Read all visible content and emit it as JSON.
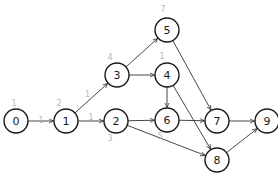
{
  "diagram": {
    "type": "directed-graph",
    "node_color": "#1a1a1a",
    "annotation_color": "#b8b8b8",
    "nodes": [
      {
        "id": "0",
        "label": "0",
        "annotation": "1"
      },
      {
        "id": "1",
        "label": "1",
        "annotation": "2"
      },
      {
        "id": "2",
        "label": "2",
        "annotation": "3"
      },
      {
        "id": "3",
        "label": "3",
        "annotation": "4"
      },
      {
        "id": "4",
        "label": "4",
        "annotation": "1"
      },
      {
        "id": "5",
        "label": "5",
        "annotation": "7"
      },
      {
        "id": "6",
        "label": "6",
        "annotation": "5"
      },
      {
        "id": "7",
        "label": "7",
        "annotation": ""
      },
      {
        "id": "8",
        "label": "8",
        "annotation": ""
      },
      {
        "id": "9",
        "label": "9",
        "annotation": ""
      }
    ],
    "edges": [
      {
        "from": "0",
        "to": "1",
        "annotation": "1"
      },
      {
        "from": "1",
        "to": "3",
        "annotation": "1"
      },
      {
        "from": "1",
        "to": "2",
        "annotation": "1"
      },
      {
        "from": "3",
        "to": "5",
        "annotation": ""
      },
      {
        "from": "3",
        "to": "4",
        "annotation": ""
      },
      {
        "from": "2",
        "to": "6",
        "annotation": ""
      },
      {
        "from": "2",
        "to": "8",
        "annotation": ""
      },
      {
        "from": "5",
        "to": "7",
        "annotation": ""
      },
      {
        "from": "4",
        "to": "6",
        "annotation": ""
      },
      {
        "from": "4",
        "to": "8",
        "annotation": ""
      },
      {
        "from": "6",
        "to": "7",
        "annotation": ""
      },
      {
        "from": "7",
        "to": "9",
        "annotation": ""
      },
      {
        "from": "8",
        "to": "9",
        "annotation": ""
      }
    ]
  }
}
